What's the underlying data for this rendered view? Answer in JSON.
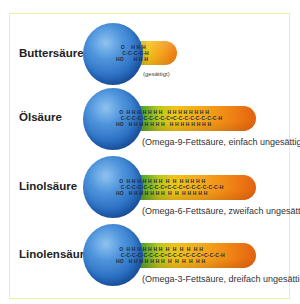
{
  "diagram": {
    "type": "fatty-acid-structures",
    "colors": {
      "frame_border": "#f3ef9a",
      "head_sphere": "#2a6fc2",
      "tail_start": "#1f6fa8",
      "tail_mid": "#f0c419",
      "tail_end": "#e2620f"
    },
    "acids": [
      {
        "name": "Buttersäure",
        "note": "(gesättigt)",
        "chain": {
          "top": "   O    H H H",
          "mid": "    C-C-C-C-H",
          "bot": "HO      H H H"
        }
      },
      {
        "name": "Ölsäure",
        "note": "(Omega-9-Fettsäure, einfach ungesättigt)",
        "chain": {
          "top": "  O  H H H H H H H   H H H H H H H H",
          "mid": "   C-C-C-C-C-C-C-C-C=C-C-C-C-C-C-C-C-H",
          "bot": "HO   H H H H H H H   H H H H H H H H"
        }
      },
      {
        "name": "Linolsäure",
        "note": "(Omega-6-Fettsäure, zweifach ungesättigt)",
        "chain": {
          "top": "  O  H H H H H H H  H  H  H H H H H",
          "mid": "   C-C-C-C-C-C-C-C=C-C-C=C-C-C-C-C-C-H",
          "bot": "HO   H H H H H H H  H  H  H H H H H"
        }
      },
      {
        "name": "Linolensäure",
        "note": "(Omega-3-Fettsäure, dreifach ungesättigt)",
        "chain": {
          "top": "  O  H H H H H H H  H  H  H  H  H H",
          "mid": "   C-C-C-C-C-C-C-C=C-C-C=C-C-C=C-C-C-H",
          "bot": "HO   H H H H H H H  H  H  H  H  H H"
        }
      }
    ]
  }
}
